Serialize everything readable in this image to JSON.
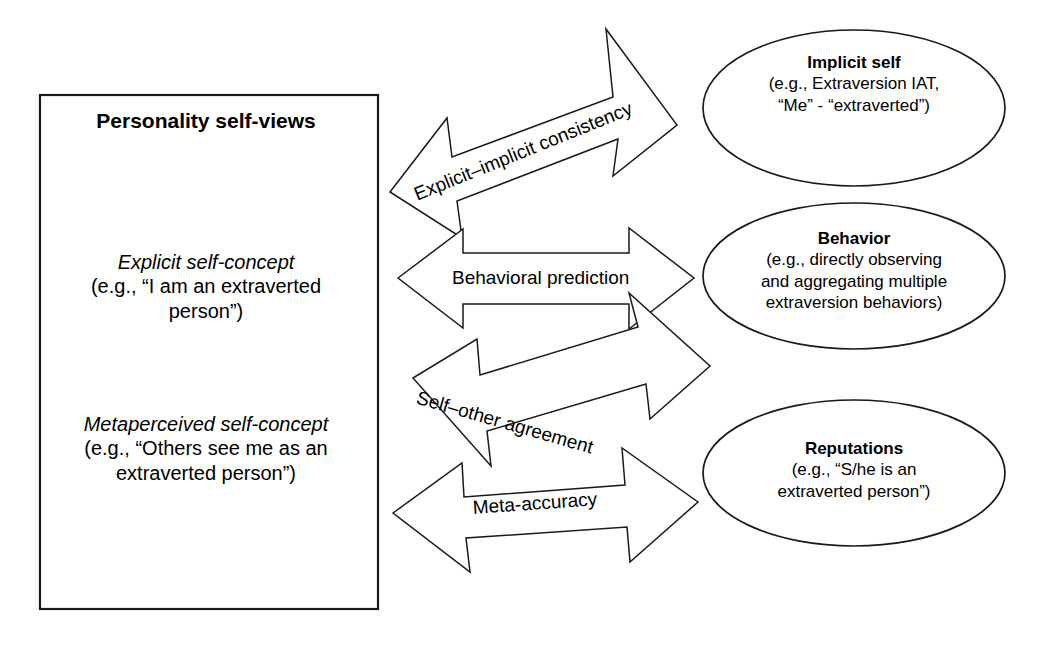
{
  "figure": {
    "type": "conceptual-diagram",
    "background_color": "#ffffff",
    "line_color": "#1a1a1a"
  },
  "left_box": {
    "title": "Personality self-views",
    "entries": [
      {
        "name": "explicit-self-concept",
        "label": "Explicit self-concept",
        "example": "(e.g., “I am an extraverted\nperson”)"
      },
      {
        "name": "metaperceived-self-concept",
        "label": "Metaperceived self-concept",
        "example": "(e.g., “Others see me as an\nextraverted person”)"
      }
    ]
  },
  "ellipses": [
    {
      "name": "implicit-self",
      "title": "Implicit self",
      "example": "(e.g., Extraversion IAT,\n“Me” - “extraverted”)"
    },
    {
      "name": "behavior",
      "title": "Behavior",
      "example": "(e.g., directly observing\nand aggregating multiple\nextraversion behaviors)"
    },
    {
      "name": "reputations",
      "title": "Reputations",
      "example": "(e.g., “S/he is an\nextraverted person”)"
    }
  ],
  "arrows": [
    {
      "name": "explicit-implicit-consistency",
      "label": "Explicit–implicit consistency",
      "from": "explicit-self-concept",
      "to": "implicit-self",
      "direction": "bidirectional",
      "orientation": "upward"
    },
    {
      "name": "behavioral-prediction",
      "label": "Behavioral prediction",
      "from": "explicit-self-concept",
      "to": "behavior",
      "direction": "bidirectional",
      "orientation": "horizontal"
    },
    {
      "name": "self-other-agreement",
      "label": "Self–other agreement",
      "from": "explicit-self-concept",
      "to": "reputations",
      "direction": "bidirectional",
      "orientation": "downward"
    },
    {
      "name": "meta-accuracy",
      "label": "Meta-accuracy",
      "from": "metaperceived-self-concept",
      "to": "reputations",
      "direction": "bidirectional",
      "orientation": "upward"
    }
  ]
}
